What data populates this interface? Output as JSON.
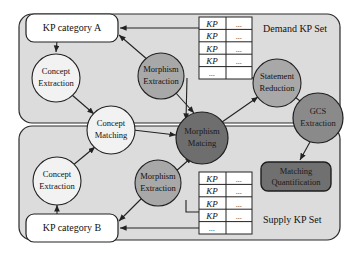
{
  "diagram": {
    "colors": {
      "canvas": "#ffffff",
      "panel": "#dcdcdc",
      "panel_border": "#2b2b2b",
      "node_light": "#f2f2f2",
      "node_mid": "#a8a8a8",
      "node_dark": "#8a8a8a",
      "node_darkest": "#6e6e6e",
      "box_fill": "#ffffff",
      "box_dark_fill": "#707070",
      "table_fill": "#ffffff",
      "line": "#222222"
    },
    "panels": [
      {
        "id": "demand",
        "label": "Demand KP Set"
      },
      {
        "id": "supply",
        "label": "Supply KP Set"
      }
    ],
    "boxes": [
      {
        "id": "kp-category-a",
        "label": "KP category A",
        "style": "light"
      },
      {
        "id": "kp-category-b",
        "label": "KP category B",
        "style": "light"
      },
      {
        "id": "matching-quantification",
        "line1": "Matching",
        "line2": "Quantification",
        "style": "dark"
      }
    ],
    "nodes": [
      {
        "id": "concept-extraction-top",
        "line1": "Concept",
        "line2": "Extraction",
        "shade": "light"
      },
      {
        "id": "concept-extraction-bottom",
        "line1": "Concept",
        "line2": "Extraction",
        "shade": "light"
      },
      {
        "id": "concept-matching",
        "line1": "Concept",
        "line2": "Matching",
        "shade": "light"
      },
      {
        "id": "morphism-extraction-top",
        "line1": "Morphism",
        "line2": "Extraction",
        "shade": "mid"
      },
      {
        "id": "morphism-extraction-bottom",
        "line1": "Morphism",
        "line2": "Extraction",
        "shade": "mid"
      },
      {
        "id": "morphism-matching",
        "line1": "Morphism",
        "line2": "Matcing",
        "shade": "darkest"
      },
      {
        "id": "statement-reduction",
        "line1": "Statement",
        "line2": "Reduction",
        "shade": "mid"
      },
      {
        "id": "gcs-extraction",
        "line1": "GCS",
        "line2": "Extraction",
        "shade": "dark"
      }
    ],
    "tables": [
      {
        "id": "demand-kp-table",
        "rows": [
          {
            "left": "KP",
            "right": "..."
          },
          {
            "left": "KP",
            "right": "..."
          },
          {
            "left": "KP",
            "right": "..."
          },
          {
            "left": "KP",
            "right": "..."
          },
          {
            "left": "...",
            "right": ""
          }
        ]
      },
      {
        "id": "supply-kp-table",
        "rows": [
          {
            "left": "KP",
            "right": "..."
          },
          {
            "left": "KP",
            "right": "..."
          },
          {
            "left": "KP",
            "right": "..."
          },
          {
            "left": "KP",
            "right": "..."
          },
          {
            "left": "...",
            "right": ""
          }
        ]
      }
    ]
  }
}
